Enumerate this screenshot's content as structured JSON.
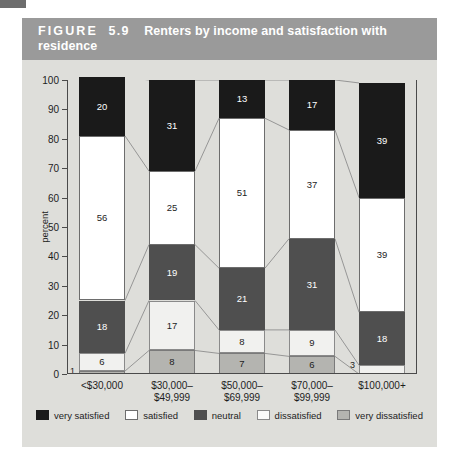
{
  "corner_mark": "",
  "figure": {
    "label": "FIGURE",
    "number": "5.9",
    "title": "Renters by income and satisfaction with residence"
  },
  "chart_data": {
    "type": "bar",
    "subtype": "stacked-100-percent",
    "title": "Renters by income and satisfaction with residence",
    "xlabel": "",
    "ylabel": "percent",
    "ylim": [
      0,
      100
    ],
    "ytick_step": 10,
    "yticks": [
      0,
      10,
      20,
      30,
      40,
      50,
      60,
      70,
      80,
      90,
      100
    ],
    "grid": false,
    "legend_position": "bottom",
    "stack_order_bottom_to_top": [
      "very dissatisfied",
      "dissatisfied",
      "neutral",
      "satisfied",
      "very satisfied"
    ],
    "categories": [
      "<$30,000",
      "$30,000–\n$49,999",
      "$50,000–\n$69,999",
      "$70,000–\n$99,999",
      "$100,000+"
    ],
    "category_lines": [
      [
        "<$30,000",
        ""
      ],
      [
        "$30,000–",
        "$49,999"
      ],
      [
        "$50,000–",
        "$69,999"
      ],
      [
        "$70,000–",
        "$99,999"
      ],
      [
        "$100,000+",
        ""
      ]
    ],
    "series": [
      {
        "name": "very satisfied",
        "color": "#1a1a1a",
        "values": [
          20,
          31,
          13,
          17,
          39
        ]
      },
      {
        "name": "satisfied",
        "color": "#ffffff",
        "values": [
          56,
          25,
          51,
          37,
          39
        ]
      },
      {
        "name": "neutral",
        "color": "#4f4f4f",
        "values": [
          18,
          19,
          21,
          31,
          18
        ]
      },
      {
        "name": "dissatisfied",
        "color": "#f1f1ef",
        "values": [
          6,
          17,
          8,
          9,
          3
        ]
      },
      {
        "name": "very dissatisfied",
        "color": "#b4b4b0",
        "values": [
          1,
          8,
          7,
          6,
          0
        ]
      }
    ]
  },
  "legend": {
    "items": [
      {
        "label": "very satisfied",
        "key": "very-satisfied"
      },
      {
        "label": "satisfied",
        "key": "satisfied"
      },
      {
        "label": "neutral",
        "key": "neutral"
      },
      {
        "label": "dissatisfied",
        "key": "dissatisfied"
      },
      {
        "label": "very dissatisfied",
        "key": "very-dissatisfied"
      }
    ]
  },
  "colors": {
    "title_bar": "#9a9a9a",
    "panel": "#dededa",
    "axis": "#4a4a4a",
    "connector": "#8d8d8d"
  }
}
